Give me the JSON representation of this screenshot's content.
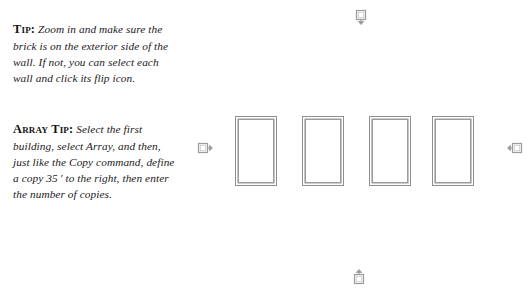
{
  "page": {
    "background_color": "#ffffff",
    "width": 532,
    "height": 288
  },
  "tips": [
    {
      "id": "tip",
      "lead": "Tip:",
      "body": " Zoom in and make sure the brick is on the exterior side of the wall. If not, you can select each wall and click its flip icon."
    },
    {
      "id": "array-tip",
      "lead": "Array Tip:",
      "body": " Select the first building, select Array, and then, just like the Copy command, define a copy 35 ′ to the right, then enter the number of copies."
    }
  ],
  "drawing": {
    "stroke_color": "#8e8f93",
    "fill_color": "#ffffff",
    "buildings": [
      {
        "name": "building-1",
        "x": 235,
        "y": 116,
        "width": 42,
        "height": 70
      },
      {
        "name": "building-2",
        "x": 302,
        "y": 116,
        "width": 42,
        "height": 70
      },
      {
        "name": "building-3",
        "x": 369,
        "y": 116,
        "width": 42,
        "height": 70
      },
      {
        "name": "building-4",
        "x": 432,
        "y": 116,
        "width": 42,
        "height": 70
      }
    ],
    "flip_icons": [
      {
        "name": "flip-icon-top",
        "direction": "down",
        "x": 352,
        "y": 9
      },
      {
        "name": "flip-icon-left",
        "direction": "right",
        "x": 197,
        "y": 139
      },
      {
        "name": "flip-icon-right",
        "direction": "left",
        "x": 505,
        "y": 139
      },
      {
        "name": "flip-icon-bottom",
        "direction": "up",
        "x": 350,
        "y": 267
      }
    ]
  }
}
